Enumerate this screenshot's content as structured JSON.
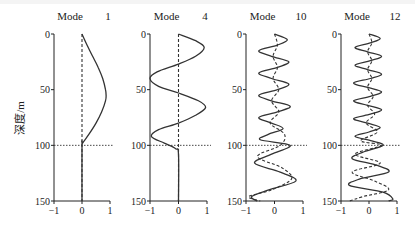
{
  "chart_data": {
    "type": "line",
    "ylabel": "深度/m",
    "yticks": [
      0,
      50,
      100,
      150
    ],
    "xticks": [
      -1,
      0,
      1
    ],
    "ylim": [
      150,
      0
    ],
    "xlim": [
      -1,
      1
    ],
    "reference_line_depth": 100,
    "panels": [
      {
        "title_label": "Mode",
        "title_number": "1",
        "series": [
          {
            "name": "solid",
            "style": "solid",
            "depth": [
              0,
              10,
              20,
              30,
              40,
              50,
              55,
              60,
              70,
              80,
              90,
              98,
              100,
              150
            ],
            "values": [
              0,
              0.18,
              0.38,
              0.58,
              0.74,
              0.84,
              0.86,
              0.84,
              0.7,
              0.5,
              0.25,
              0.02,
              0,
              0
            ]
          },
          {
            "name": "dashed",
            "style": "dashed",
            "depth": [
              0,
              150
            ],
            "values": [
              0,
              0
            ]
          }
        ]
      },
      {
        "title_label": "Mode",
        "title_number": "4",
        "series": [
          {
            "name": "solid",
            "style": "solid",
            "depth": [
              0,
              6,
              12,
              20,
              27,
              34,
              40,
              47,
              53,
              60,
              66,
              73,
              80,
              86,
              92,
              98,
              103,
              108,
              150
            ],
            "values": [
              0,
              0.6,
              0.9,
              0.6,
              0,
              -0.75,
              -1.0,
              -0.7,
              0,
              0.7,
              0.95,
              0.6,
              0,
              -0.7,
              -0.95,
              -0.5,
              -0.1,
              0,
              0
            ]
          },
          {
            "name": "dashed",
            "style": "dashed",
            "depth": [
              0,
              150
            ],
            "values": [
              0,
              0
            ]
          }
        ]
      },
      {
        "title_label": "Mode",
        "title_number": "10",
        "series": [
          {
            "name": "solid",
            "style": "solid",
            "depth": [
              0,
              5,
              10,
              15,
              20,
              25,
              30,
              35,
              40,
              45,
              50,
              55,
              60,
              65,
              70,
              75,
              80,
              85,
              90,
              95,
              100,
              108,
              116,
              124,
              132,
              140,
              146,
              150
            ],
            "values": [
              0,
              0.45,
              0.1,
              -0.55,
              -0.1,
              0.5,
              0.1,
              -0.55,
              -0.1,
              0.5,
              0.1,
              -0.55,
              -0.1,
              0.55,
              0.1,
              -0.55,
              -0.1,
              0.3,
              -0.2,
              -0.5,
              0.55,
              -0.1,
              -0.7,
              0.2,
              0.75,
              -0.2,
              -0.8,
              -0.6
            ]
          },
          {
            "name": "dashed",
            "style": "dashed",
            "depth": [
              0,
              10,
              20,
              30,
              40,
              50,
              60,
              70,
              80,
              90,
              100,
              110,
              120,
              130,
              140,
              146,
              150
            ],
            "values": [
              0,
              0.1,
              -0.05,
              0.1,
              -0.05,
              0.15,
              -0.1,
              0.15,
              -0.15,
              0.35,
              0.2,
              -0.6,
              0.25,
              0.6,
              -0.1,
              -0.9,
              -0.5
            ]
          }
        ]
      },
      {
        "title_label": "Mode",
        "title_number": "12",
        "series": [
          {
            "name": "solid",
            "style": "solid",
            "depth": [
              0,
              4,
              8,
              12,
              16,
              20,
              24,
              28,
              32,
              36,
              40,
              44,
              48,
              52,
              56,
              60,
              64,
              68,
              72,
              76,
              80,
              84,
              88,
              92,
              96,
              100,
              106,
              112,
              118,
              124,
              130,
              136,
              142,
              148,
              150
            ],
            "values": [
              0,
              0.4,
              0.05,
              -0.5,
              -0.05,
              0.45,
              0.05,
              -0.5,
              -0.05,
              0.45,
              0.05,
              -0.55,
              -0.05,
              0.45,
              0.05,
              -0.55,
              -0.05,
              0.45,
              0.05,
              -0.55,
              -0.05,
              0.4,
              0.0,
              -0.5,
              0.1,
              0.5,
              -0.2,
              -0.6,
              0.3,
              0.7,
              -0.3,
              -0.7,
              0.5,
              0.85,
              0.7
            ]
          },
          {
            "name": "dashed",
            "style": "dashed",
            "depth": [
              0,
              8,
              16,
              24,
              32,
              40,
              48,
              56,
              64,
              72,
              80,
              88,
              96,
              100,
              108,
              116,
              124,
              132,
              140,
              146,
              150
            ],
            "values": [
              0,
              0.1,
              -0.05,
              0.1,
              -0.05,
              0.1,
              -0.05,
              0.15,
              -0.05,
              0.2,
              -0.1,
              0.3,
              -0.3,
              0.45,
              -0.5,
              0.4,
              -0.6,
              0.2,
              0.7,
              -0.2,
              -0.7
            ]
          }
        ]
      }
    ]
  },
  "ylabel": "深度/m",
  "tick_labels": {
    "y0": "0",
    "y50": "50",
    "y100": "100",
    "y150": "150",
    "xm1": "−1",
    "x0": "0",
    "x1": "1"
  }
}
